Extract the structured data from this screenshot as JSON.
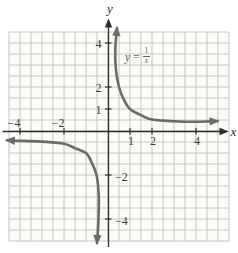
{
  "figure": {
    "axis_labels": {
      "x": "x",
      "y": "y"
    },
    "equation": {
      "lhs": "y",
      "rel": "=",
      "numerator": "1",
      "denominator": "x"
    }
  },
  "colors": {
    "page_bg": "#ffffff",
    "plot_bg": "#fbfbf8",
    "grid_line": "#c5c8c4",
    "axis": "#2d2d2d",
    "curve": "#6b6b6b",
    "tick_text": "#3b3b3b",
    "equation_text": "#5e5e5e"
  },
  "chart_data": {
    "type": "line",
    "function": "y = 1/x",
    "xlabel": "x",
    "ylabel": "y",
    "xlim": [
      -4.7,
      5.5
    ],
    "ylim": [
      -5.1,
      4.7
    ],
    "grid": true,
    "grid_step": 0.5,
    "x_ticks": [
      {
        "value": -4,
        "label": "−4"
      },
      {
        "value": -2,
        "label": "−2"
      },
      {
        "value": 1,
        "label": "1"
      },
      {
        "value": 2,
        "label": "2"
      },
      {
        "value": 4,
        "label": "4"
      }
    ],
    "y_ticks": [
      {
        "value": 4,
        "label": "4"
      },
      {
        "value": 2,
        "label": "2"
      },
      {
        "value": 1,
        "label": "1"
      },
      {
        "value": -2,
        "label": "−2"
      },
      {
        "value": -4,
        "label": "−4"
      }
    ],
    "series": [
      {
        "name": "branch-quadrant-1",
        "points": [
          [
            0.41,
            4.68
          ],
          [
            0.33,
            3.7
          ],
          [
            0.36,
            2.8
          ],
          [
            0.5,
            2.0
          ],
          [
            0.73,
            1.4
          ],
          [
            1,
            1
          ],
          [
            1.5,
            0.72
          ],
          [
            2,
            0.52
          ],
          [
            3,
            0.44
          ],
          [
            4.2,
            0.42
          ],
          [
            4.98,
            0.45
          ]
        ]
      },
      {
        "name": "branch-quadrant-3",
        "points": [
          [
            -4.6,
            -0.42
          ],
          [
            -4.2,
            -0.44
          ],
          [
            -3,
            -0.48
          ],
          [
            -2,
            -0.58
          ],
          [
            -1.5,
            -0.78
          ],
          [
            -1,
            -1
          ],
          [
            -0.73,
            -1.45
          ],
          [
            -0.5,
            -2.1
          ],
          [
            -0.42,
            -3.0
          ],
          [
            -0.44,
            -4.2
          ],
          [
            -0.5,
            -5.09
          ]
        ]
      }
    ],
    "layout": {
      "origin_px": {
        "x": 108,
        "y": 131
      },
      "unit_px": 22,
      "grid_cells": {
        "left": 9,
        "right": 11,
        "up": 9,
        "down": 10
      }
    }
  }
}
